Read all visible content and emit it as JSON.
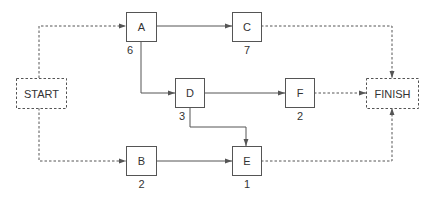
{
  "diagram": {
    "type": "activity-network",
    "colors": {
      "stroke": "#555555",
      "text": "#333333",
      "background": "#ffffff"
    },
    "nodes": [
      {
        "id": "START",
        "label": "START",
        "duration": null,
        "style": "dashed",
        "x": 16,
        "y": 78,
        "w": 50,
        "h": 30
      },
      {
        "id": "A",
        "label": "A",
        "duration": "6",
        "style": "solid",
        "x": 126,
        "y": 12,
        "w": 30,
        "h": 29
      },
      {
        "id": "B",
        "label": "B",
        "duration": "2",
        "style": "solid",
        "x": 126,
        "y": 146,
        "w": 30,
        "h": 29
      },
      {
        "id": "C",
        "label": "C",
        "duration": "7",
        "style": "solid",
        "x": 232,
        "y": 12,
        "w": 29,
        "h": 29
      },
      {
        "id": "D",
        "label": "D",
        "duration": "3",
        "style": "solid",
        "x": 175,
        "y": 78,
        "w": 29,
        "h": 29
      },
      {
        "id": "E",
        "label": "E",
        "duration": "1",
        "style": "solid",
        "x": 232,
        "y": 146,
        "w": 29,
        "h": 29
      },
      {
        "id": "F",
        "label": "F",
        "duration": "2",
        "style": "solid",
        "x": 285,
        "y": 78,
        "w": 29,
        "h": 29
      },
      {
        "id": "FINISH",
        "label": "FINISH",
        "duration": null,
        "style": "dashed",
        "x": 366,
        "y": 78,
        "w": 52,
        "h": 30
      }
    ],
    "edges": [
      {
        "from": "START",
        "to": "A",
        "style": "dashed",
        "points": "39,78 39,26 126,26"
      },
      {
        "from": "START",
        "to": "B",
        "style": "dashed",
        "points": "39,108 39,161 126,161"
      },
      {
        "from": "A",
        "to": "C",
        "style": "solid",
        "points": "156,26 232,26"
      },
      {
        "from": "A",
        "to": "D",
        "style": "solid",
        "points": "141,41 141,93 175,93"
      },
      {
        "from": "C",
        "to": "FINISH",
        "style": "dashed",
        "points": "261,26 392,26 392,78"
      },
      {
        "from": "D",
        "to": "F",
        "style": "solid",
        "points": "204,93 285,93"
      },
      {
        "from": "D",
        "to": "E",
        "style": "solid",
        "points": "190,107 190,127 246,127 246,146"
      },
      {
        "from": "F",
        "to": "FINISH",
        "style": "dashed",
        "points": "314,93 366,93"
      },
      {
        "from": "B",
        "to": "E",
        "style": "solid",
        "points": "156,161 232,161"
      },
      {
        "from": "E",
        "to": "FINISH",
        "style": "dashed",
        "points": "261,161 392,161 392,108"
      }
    ]
  }
}
